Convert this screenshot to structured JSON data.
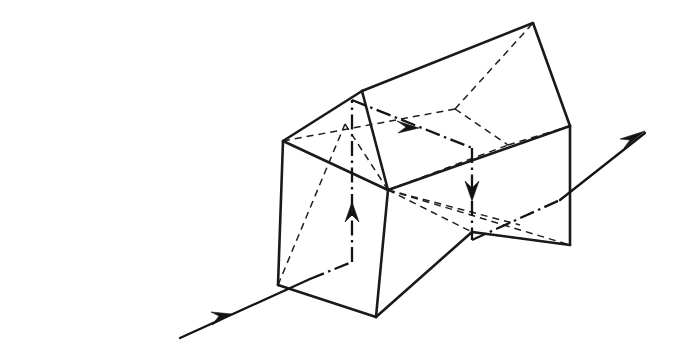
{
  "figure": {
    "kind": "technical-line-drawing",
    "background_color": "#ffffff",
    "line_color": "#1a1a1a",
    "width": 675,
    "height": 352,
    "labels": [],
    "legend": []
  },
  "chart_data": {
    "type": "diagram",
    "xlabel": "",
    "ylabel": "",
    "coordinate_space": "pixels, origin top-left, 675x352",
    "line_styles": {
      "visible_edge": "solid",
      "hidden_edge": "dashed",
      "ray": "dash-dot",
      "external_ray": "solid-with-arrowhead"
    },
    "vertices": {
      "left_top_apex": [
        362,
        91
      ],
      "left_front_upper": [
        283,
        141
      ],
      "left_front_lower": [
        278,
        285
      ],
      "ridge_right": [
        533,
        23
      ],
      "right_top_front": [
        570,
        126
      ],
      "right_bottom_front": [
        570,
        245
      ],
      "mid_front_upper": [
        388,
        190
      ],
      "mid_front_bottom": [
        376,
        317
      ],
      "notch_vertex": [
        472,
        232
      ],
      "back_upper_mid": [
        455,
        109
      ],
      "back_right_upper": [
        508,
        145
      ],
      "back_left_mid": [
        345,
        124
      ]
    },
    "solid_edges": [
      [
        [
          283,
          141
        ],
        [
          362,
          91
        ]
      ],
      [
        [
          362,
          91
        ],
        [
          533,
          23
        ]
      ],
      [
        [
          533,
          23
        ],
        [
          570,
          126
        ]
      ],
      [
        [
          283,
          141
        ],
        [
          388,
          190
        ]
      ],
      [
        [
          388,
          190
        ],
        [
          570,
          126
        ]
      ],
      [
        [
          283,
          141
        ],
        [
          278,
          285
        ]
      ],
      [
        [
          278,
          285
        ],
        [
          376,
          317
        ]
      ],
      [
        [
          376,
          317
        ],
        [
          388,
          190
        ]
      ],
      [
        [
          362,
          91
        ],
        [
          388,
          190
        ]
      ],
      [
        [
          570,
          126
        ],
        [
          570,
          245
        ]
      ],
      [
        [
          376,
          317
        ],
        [
          472,
          232
        ]
      ],
      [
        [
          472,
          232
        ],
        [
          570,
          245
        ]
      ]
    ],
    "hidden_edges": [
      [
        [
          283,
          141
        ],
        [
          455,
          109
        ]
      ],
      [
        [
          455,
          109
        ],
        [
          533,
          23
        ]
      ],
      [
        [
          455,
          109
        ],
        [
          508,
          145
        ]
      ],
      [
        [
          508,
          145
        ],
        [
          570,
          126
        ]
      ],
      [
        [
          345,
          124
        ],
        [
          388,
          190
        ]
      ],
      [
        [
          388,
          190
        ],
        [
          508,
          145
        ]
      ],
      [
        [
          388,
          190
        ],
        [
          570,
          245
        ]
      ],
      [
        [
          388,
          190
        ],
        [
          472,
          232
        ]
      ],
      [
        [
          278,
          285
        ],
        [
          345,
          124
        ]
      ],
      [
        [
          388,
          190
        ],
        [
          520,
          225
        ]
      ]
    ],
    "ray_segments": [
      {
        "name": "entry-external",
        "style": "solid",
        "points": [
          [
            180,
            338
          ],
          [
            310,
            279
          ]
        ],
        "arrow_at": [
          228,
          317
        ],
        "arrow_direction": "up-right"
      },
      {
        "name": "entry-internal-diagonal",
        "style": "dash-dot",
        "points": [
          [
            310,
            279
          ],
          [
            352,
            262
          ]
        ],
        "arrow_at": null
      },
      {
        "name": "internal-vertical-up",
        "style": "dash-dot",
        "points": [
          [
            352,
            262
          ],
          [
            352,
            100
          ]
        ],
        "arrow_at": [
          352,
          206
        ],
        "arrow_direction": "up"
      },
      {
        "name": "internal-top-diagonal",
        "style": "dash-dot",
        "points": [
          [
            352,
            100
          ],
          [
            472,
            148
          ]
        ],
        "arrow_at": [
          412,
          124
        ],
        "arrow_direction": "down-right"
      },
      {
        "name": "internal-vertical-down",
        "style": "dash-dot",
        "points": [
          [
            472,
            148
          ],
          [
            472,
            240
          ]
        ],
        "arrow_at": [
          472,
          195
        ],
        "arrow_direction": "down"
      },
      {
        "name": "exit-internal-diagonal",
        "style": "dash-dot",
        "points": [
          [
            472,
            240
          ],
          [
            560,
            200
          ]
        ],
        "arrow_at": null
      },
      {
        "name": "exit-external",
        "style": "solid",
        "points": [
          [
            560,
            200
          ],
          [
            645,
            133
          ]
        ],
        "arrow_at": [
          640,
          136
        ],
        "arrow_direction": "up-right"
      }
    ],
    "arrows": [
      {
        "name": "incoming-ray-arrow",
        "x": 228,
        "y": 317,
        "angle_deg": -24
      },
      {
        "name": "internal-up-arrow",
        "x": 352,
        "y": 206,
        "angle_deg": -90
      },
      {
        "name": "internal-diagonal-arrow",
        "x": 414,
        "y": 125,
        "angle_deg": 22
      },
      {
        "name": "internal-down-arrow",
        "x": 472,
        "y": 196,
        "angle_deg": 90
      },
      {
        "name": "outgoing-ray-arrow",
        "x": 641,
        "y": 135,
        "angle_deg": -38
      }
    ]
  }
}
